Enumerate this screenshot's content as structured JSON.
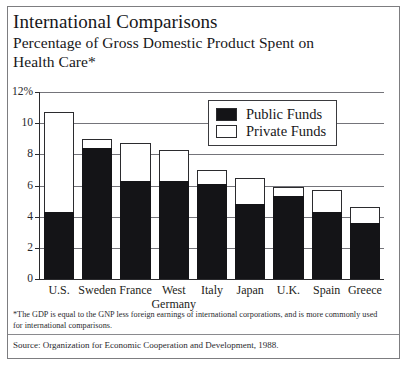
{
  "figure": {
    "title": "International Comparisons",
    "subtitle_line1": "Percentage of Gross Domestic Product Spent on",
    "subtitle_line2": "Health Care*",
    "footnote": "*The GDP is equal to the GNP less foreign earnings of international corporations, and is more commonly used for international comparisons.",
    "source": "Source:  Organization for Economic Cooperation and Development, 1988."
  },
  "colors": {
    "public_funds": "#141417",
    "private_funds": "#ffffff",
    "axis": "#2b2b2e",
    "gridline": "#74747a",
    "frame": "#7d7d80",
    "text": "#17171a"
  },
  "chart_data": {
    "type": "bar",
    "title": "International Comparisons",
    "subtitle": "Percentage of Gross Domestic Product Spent on Health Care*",
    "stacked": true,
    "xlabel": "",
    "ylabel": "",
    "ylim": [
      0,
      12
    ],
    "ytick_labels": [
      "0",
      "2",
      "4",
      "6",
      "8",
      "10",
      "12%"
    ],
    "ytick_values": [
      0,
      2,
      4,
      6,
      8,
      10,
      12
    ],
    "grid": true,
    "legend_position": "inside-top-center",
    "categories": [
      "U.S.",
      "Sweden",
      "France",
      "West\nGermany",
      "Italy",
      "Japan",
      "U.K.",
      "Spain",
      "Greece"
    ],
    "category_labels": [
      [
        "U.S."
      ],
      [
        "Sweden"
      ],
      [
        "France"
      ],
      [
        "West",
        "Germany"
      ],
      [
        "Italy"
      ],
      [
        "Japan"
      ],
      [
        "U.K."
      ],
      [
        "Spain"
      ],
      [
        "Greece"
      ]
    ],
    "series": [
      {
        "name": "Public Funds",
        "color": "#141417",
        "values": [
          4.3,
          8.4,
          6.3,
          6.3,
          6.1,
          4.8,
          5.3,
          4.3,
          3.6
        ]
      },
      {
        "name": "Private Funds",
        "color": "#ffffff",
        "values": [
          6.4,
          0.6,
          2.4,
          2.0,
          0.9,
          1.7,
          0.6,
          1.4,
          1.0
        ]
      }
    ],
    "totals": [
      10.7,
      9.0,
      8.7,
      8.3,
      7.0,
      6.5,
      5.9,
      5.7,
      4.6
    ]
  },
  "legend": {
    "items": [
      {
        "label": "Public Funds",
        "swatch": "filled"
      },
      {
        "label": "Private Funds",
        "swatch": "hollow"
      }
    ]
  }
}
